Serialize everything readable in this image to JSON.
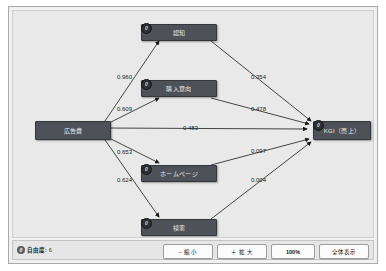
{
  "window": {
    "title": ""
  },
  "diagram": {
    "type": "path-diagram",
    "nodes": [
      {
        "id": "ninchi",
        "label": "認知",
        "badge": "0"
      },
      {
        "id": "kounyu",
        "label": "購入意向",
        "badge": "0"
      },
      {
        "id": "kokokuhi",
        "label": "広告費",
        "badge": ""
      },
      {
        "id": "kgi",
        "label": "KGI（売上）",
        "badge": "0"
      },
      {
        "id": "homepage",
        "label": "ホームページ",
        "badge": "0"
      },
      {
        "id": "kensaku",
        "label": "検索",
        "badge": "0"
      }
    ],
    "edges": [
      {
        "from": "kokokuhi",
        "to": "ninchi",
        "coefficient": "0.960"
      },
      {
        "from": "kokokuhi",
        "to": "kounyu",
        "coefficient": "0.609"
      },
      {
        "from": "kokokuhi",
        "to": "kgi",
        "coefficient": "0.483"
      },
      {
        "from": "kokokuhi",
        "to": "homepage",
        "coefficient": "0.653"
      },
      {
        "from": "kokokuhi",
        "to": "kensaku",
        "coefficient": "0.624"
      },
      {
        "from": "ninchi",
        "to": "kgi",
        "coefficient": "0.354"
      },
      {
        "from": "kounyu",
        "to": "kgi",
        "coefficient": "0.478"
      },
      {
        "from": "homepage",
        "to": "kgi",
        "coefficient": "0.097"
      },
      {
        "from": "kensaku",
        "to": "kgi",
        "coefficient": "0.004"
      }
    ]
  },
  "statusbar": {
    "badge": "0",
    "label": "自由度:",
    "value": "6",
    "buttons": {
      "zoom_out": "− 縮 小",
      "zoom_in": "＋ 拡 大",
      "zoom_100": "100%",
      "fit": "全体表示"
    }
  },
  "colors": {
    "node_fill": "#4e5258",
    "canvas_bg": "#e9e9e9",
    "edge": "#1a1a1a"
  }
}
